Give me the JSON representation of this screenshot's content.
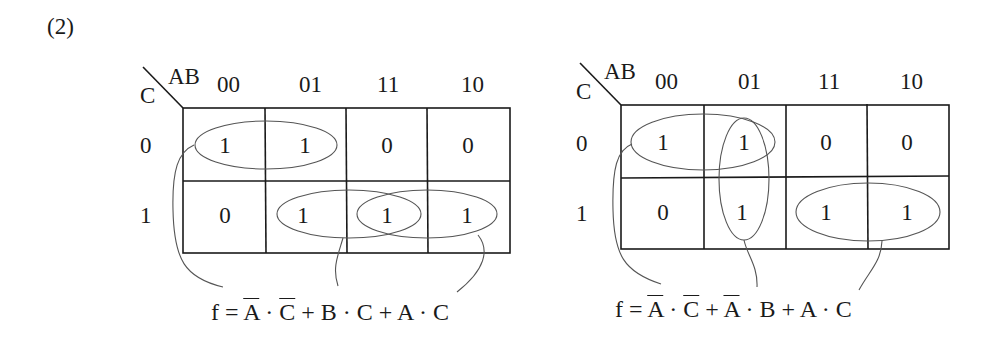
{
  "problem_label": "(2)",
  "maps": [
    {
      "row_var": "C",
      "col_var": "AB",
      "col_labels": [
        "00",
        "01",
        "11",
        "10"
      ],
      "row_labels": [
        "0",
        "1"
      ],
      "cells": [
        [
          "1",
          "1",
          "0",
          "0"
        ],
        [
          "0",
          "1",
          "1",
          "1"
        ]
      ],
      "groups": [
        {
          "name": "A'C'",
          "cells": [
            [
              0,
              0
            ],
            [
              0,
              1
            ]
          ]
        },
        {
          "name": "BC",
          "cells": [
            [
              1,
              1
            ],
            [
              1,
              2
            ]
          ]
        },
        {
          "name": "AC",
          "cells": [
            [
              1,
              2
            ],
            [
              1,
              3
            ]
          ]
        }
      ],
      "formula": {
        "lhs": "f =",
        "terms": [
          {
            "parts": [
              {
                "t": "A",
                "bar": true
              },
              {
                "t": " · "
              },
              {
                "t": "C",
                "bar": true
              }
            ]
          },
          {
            "parts": [
              {
                "t": "B"
              },
              {
                "t": " · "
              },
              {
                "t": "C"
              }
            ]
          },
          {
            "parts": [
              {
                "t": "A"
              },
              {
                "t": " · "
              },
              {
                "t": "C"
              }
            ]
          }
        ],
        "plus": " + "
      }
    },
    {
      "row_var": "C",
      "col_var": "AB",
      "col_labels": [
        "00",
        "01",
        "11",
        "10"
      ],
      "row_labels": [
        "0",
        "1"
      ],
      "cells": [
        [
          "1",
          "1",
          "0",
          "0"
        ],
        [
          "0",
          "1",
          "1",
          "1"
        ]
      ],
      "groups": [
        {
          "name": "A'C'",
          "cells": [
            [
              0,
              0
            ],
            [
              0,
              1
            ]
          ]
        },
        {
          "name": "A'B",
          "cells": [
            [
              0,
              1
            ],
            [
              1,
              1
            ]
          ]
        },
        {
          "name": "AC",
          "cells": [
            [
              1,
              2
            ],
            [
              1,
              3
            ]
          ]
        }
      ],
      "formula": {
        "lhs": "f =",
        "terms": [
          {
            "parts": [
              {
                "t": "A",
                "bar": true
              },
              {
                "t": " · "
              },
              {
                "t": "C",
                "bar": true
              }
            ]
          },
          {
            "parts": [
              {
                "t": "A",
                "bar": true
              },
              {
                "t": " · "
              },
              {
                "t": "B"
              }
            ]
          },
          {
            "parts": [
              {
                "t": "A"
              },
              {
                "t": " · "
              },
              {
                "t": "C"
              }
            ]
          }
        ],
        "plus": " + "
      }
    }
  ]
}
